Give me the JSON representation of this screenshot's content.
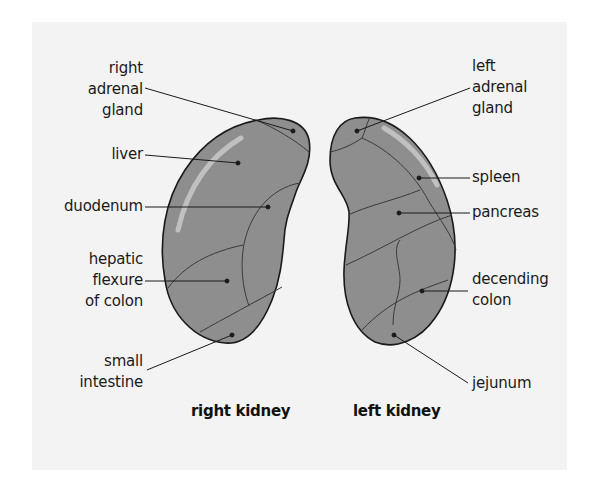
{
  "diagram": {
    "background_color": "#f3f3f3",
    "kidney_fill": "#8e8e8e",
    "outline_color": "#1a1a1a",
    "right_kidney": {
      "title": "right kidney",
      "labels": [
        {
          "id": "right-adrenal-gland",
          "line1": "right",
          "line2": "adrenal",
          "line3": "gland"
        },
        {
          "id": "liver",
          "line1": "liver"
        },
        {
          "id": "duodenum",
          "line1": "duodenum"
        },
        {
          "id": "hepatic-flexure-of-colon",
          "line1": "hepatic",
          "line2": "flexure",
          "line3": "of colon"
        },
        {
          "id": "small-intestine",
          "line1": "small",
          "line2": "intestine"
        }
      ]
    },
    "left_kidney": {
      "title": "left kidney",
      "labels": [
        {
          "id": "left-adrenal-gland",
          "line1": "left",
          "line2": "adrenal",
          "line3": "gland"
        },
        {
          "id": "spleen",
          "line1": "spleen"
        },
        {
          "id": "pancreas",
          "line1": "pancreas"
        },
        {
          "id": "decending-colon",
          "line1": "decending",
          "line2": "colon"
        },
        {
          "id": "jejunum",
          "line1": "jejunum"
        }
      ]
    }
  }
}
